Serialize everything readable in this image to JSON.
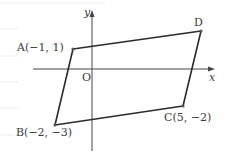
{
  "diagram": {
    "type": "coordinate-plane-quadrilateral",
    "axes": {
      "x_label": "x",
      "y_label": "y",
      "origin_label": "O"
    },
    "points": [
      {
        "name": "A",
        "label": "A(−1, 1)",
        "x": -1,
        "y": 1
      },
      {
        "name": "B",
        "label": "B(−2, −3)",
        "x": -2,
        "y": -3
      },
      {
        "name": "C",
        "label": "C(5, −2)",
        "x": 5,
        "y": -2
      },
      {
        "name": "D",
        "label": "D",
        "x": null,
        "y": null
      }
    ],
    "polygon_order": [
      "A",
      "D",
      "C",
      "B"
    ],
    "colors": {
      "line": "#2b2b2b",
      "axis": "#444444",
      "text": "#3a3a3a",
      "rule": "#eeeeee"
    }
  }
}
